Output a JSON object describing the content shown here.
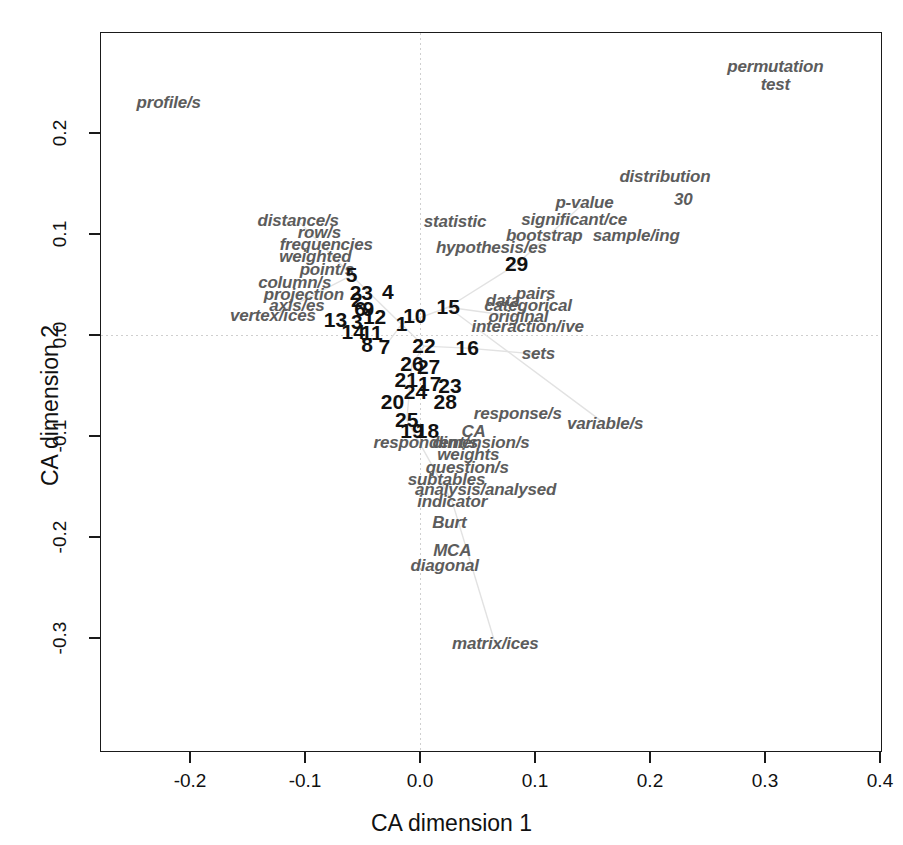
{
  "chart_data": {
    "type": "scatter",
    "title": "",
    "xlabel": "CA dimension 1",
    "ylabel": "CA dimension 2",
    "xlim": [
      -0.28,
      0.4175
    ],
    "ylim": [
      -0.315,
      0.285
    ],
    "xticks": [
      "-0.2",
      "-0.1",
      "0.0",
      "0.1",
      "0.2",
      "0.3",
      "0.4"
    ],
    "xtickvals": [
      -0.2,
      -0.1,
      0.0,
      0.1,
      0.2,
      0.3,
      0.4
    ],
    "yticks": [
      "0.2",
      "0.1",
      "0.0",
      "-0.1",
      "-0.2",
      "-0.3"
    ],
    "ytickvals": [
      0.2,
      0.1,
      0.0,
      -0.1,
      -0.2,
      -0.3
    ],
    "grid": false,
    "legend": "none",
    "zero_reference_lines": true,
    "colors": {
      "word_label": "#5c5c5c",
      "chapter_number": "#111111",
      "axis": "#1a1a1a",
      "edge": "#e2e2e2",
      "zero_line": "#cfcfcf"
    },
    "series": [
      {
        "name": "terms",
        "style": "italic-gray-text",
        "points": [
          {
            "label": "profile/s",
            "x": -0.2185,
            "y": 0.23
          },
          {
            "label": "permutation",
            "x": 0.309,
            "y": 0.265
          },
          {
            "label": "test",
            "x": 0.309,
            "y": 0.248
          },
          {
            "label": "distribution",
            "x": 0.213,
            "y": 0.156
          },
          {
            "label": "p-value",
            "x": 0.143,
            "y": 0.131
          },
          {
            "label": "30",
            "x": 0.229,
            "y": 0.134
          },
          {
            "label": "significant/ce",
            "x": 0.134,
            "y": 0.114
          },
          {
            "label": "distance/s",
            "x": -0.106,
            "y": 0.113
          },
          {
            "label": "statistic",
            "x": 0.0305,
            "y": 0.112
          },
          {
            "label": "bootstrap",
            "x": 0.108,
            "y": 0.098
          },
          {
            "label": "sample/ing",
            "x": 0.188,
            "y": 0.098
          },
          {
            "label": "row/s",
            "x": -0.0875,
            "y": 0.101
          },
          {
            "label": "frequencies",
            "x": -0.0815,
            "y": 0.089
          },
          {
            "label": "hypothesis/es",
            "x": 0.062,
            "y": 0.086
          },
          {
            "label": "weighted",
            "x": -0.091,
            "y": 0.077
          },
          {
            "label": "point/s",
            "x": -0.081,
            "y": 0.064
          },
          {
            "label": "column/s",
            "x": -0.109,
            "y": 0.051
          },
          {
            "label": "projection",
            "x": -0.101,
            "y": 0.04
          },
          {
            "label": "pairs",
            "x": 0.1005,
            "y": 0.041
          },
          {
            "label": "data",
            "x": 0.072,
            "y": 0.034
          },
          {
            "label": "categorical",
            "x": 0.094,
            "y": 0.029
          },
          {
            "label": "axis/es",
            "x": -0.107,
            "y": 0.029
          },
          {
            "label": "original",
            "x": 0.0855,
            "y": 0.018
          },
          {
            "label": "vertex/ices",
            "x": -0.128,
            "y": 0.019
          },
          {
            "label": "interaction/ive",
            "x": 0.0935,
            "y": 0.008
          },
          {
            "label": "sets",
            "x": 0.103,
            "y": -0.019
          },
          {
            "label": "response/s",
            "x": 0.085,
            "y": -0.078
          },
          {
            "label": "variable/s",
            "x": 0.161,
            "y": -0.088
          },
          {
            "label": "CA",
            "x": 0.0465,
            "y": -0.0965
          },
          {
            "label": "respondent/s",
            "x": 0.005,
            "y": -0.107
          },
          {
            "label": "dimension/s",
            "x": 0.053,
            "y": -0.107
          },
          {
            "label": "weights",
            "x": 0.042,
            "y": -0.1185
          },
          {
            "label": "question/s",
            "x": 0.041,
            "y": -0.132
          },
          {
            "label": "subtables",
            "x": 0.023,
            "y": -0.1435
          },
          {
            "label": "analysis/analysed",
            "x": 0.057,
            "y": -0.153
          },
          {
            "label": "indicator",
            "x": 0.028,
            "y": -0.165
          },
          {
            "label": "Burt",
            "x": 0.0255,
            "y": -0.186
          },
          {
            "label": "MCA",
            "x": 0.028,
            "y": -0.214
          },
          {
            "label": "diagonal",
            "x": 0.0215,
            "y": -0.229
          },
          {
            "label": "matrix/ices",
            "x": 0.0655,
            "y": -0.306
          }
        ]
      },
      {
        "name": "chapters",
        "style": "bold-black-number",
        "points": [
          {
            "label": "5",
            "x": -0.0595,
            "y": 0.059
          },
          {
            "label": "23",
            "x": -0.051,
            "y": 0.042
          },
          {
            "label": "2",
            "x": -0.055,
            "y": 0.035
          },
          {
            "label": "4",
            "x": -0.028,
            "y": 0.043
          },
          {
            "label": "6",
            "x": -0.052,
            "y": 0.0255
          },
          {
            "label": "9",
            "x": -0.045,
            "y": 0.0255
          },
          {
            "label": "13",
            "x": -0.0735,
            "y": 0.0145
          },
          {
            "label": "3",
            "x": -0.055,
            "y": 0.0125
          },
          {
            "label": "12",
            "x": -0.0395,
            "y": 0.018
          },
          {
            "label": "10",
            "x": -0.0045,
            "y": 0.0185
          },
          {
            "label": "15",
            "x": 0.0245,
            "y": 0.0275
          },
          {
            "label": "1",
            "x": -0.016,
            "y": 0.0105
          },
          {
            "label": "14",
            "x": -0.058,
            "y": 0.003
          },
          {
            "label": "11",
            "x": -0.042,
            "y": 0.002
          },
          {
            "label": "8",
            "x": -0.046,
            "y": -0.0095
          },
          {
            "label": "7",
            "x": -0.031,
            "y": -0.012
          },
          {
            "label": "22",
            "x": 0.0035,
            "y": -0.011
          },
          {
            "label": "16",
            "x": 0.041,
            "y": -0.013
          },
          {
            "label": "26",
            "x": -0.007,
            "y": -0.029
          },
          {
            "label": "27",
            "x": 0.0075,
            "y": -0.032
          },
          {
            "label": "21",
            "x": -0.012,
            "y": -0.045
          },
          {
            "label": "17",
            "x": 0.0085,
            "y": -0.049
          },
          {
            "label": "23b",
            "x": 0.026,
            "y": -0.05
          },
          {
            "label": "24",
            "x": -0.004,
            "y": -0.056
          },
          {
            "label": "20",
            "x": -0.024,
            "y": -0.0665
          },
          {
            "label": "28",
            "x": 0.022,
            "y": -0.066
          },
          {
            "label": "25",
            "x": -0.0115,
            "y": -0.084
          },
          {
            "label": "19",
            "x": -0.007,
            "y": -0.095
          },
          {
            "label": "18",
            "x": 0.0065,
            "y": -0.095
          },
          {
            "label": "29",
            "x": 0.084,
            "y": 0.07
          }
        ]
      }
    ],
    "edges": [
      {
        "x1": -0.016,
        "y1": 0.0105,
        "x2": 0.0245,
        "y2": 0.0275
      },
      {
        "x1": -0.016,
        "y1": 0.0105,
        "x2": 0.0035,
        "y2": -0.011
      },
      {
        "x1": 0.0035,
        "y1": -0.011,
        "x2": 0.041,
        "y2": -0.013
      },
      {
        "x1": 0.041,
        "y1": -0.013,
        "x2": 0.103,
        "y2": -0.019
      },
      {
        "x1": 0.0245,
        "y1": 0.0275,
        "x2": 0.0855,
        "y2": 0.018
      },
      {
        "x1": 0.0245,
        "y1": 0.0275,
        "x2": 0.084,
        "y2": 0.07
      },
      {
        "x1": 0.084,
        "y1": 0.07,
        "x2": 0.143,
        "y2": 0.131
      },
      {
        "x1": -0.016,
        "y1": 0.0105,
        "x2": -0.0595,
        "y2": 0.059
      },
      {
        "x1": -0.016,
        "y1": 0.0105,
        "x2": -0.031,
        "y2": -0.012
      },
      {
        "x1": 0.0035,
        "y1": -0.011,
        "x2": -0.007,
        "y2": -0.029
      },
      {
        "x1": -0.007,
        "y1": -0.029,
        "x2": -0.0115,
        "y2": -0.084
      },
      {
        "x1": -0.0115,
        "y1": -0.084,
        "x2": 0.028,
        "y2": -0.165
      },
      {
        "x1": 0.028,
        "y1": -0.165,
        "x2": 0.0655,
        "y2": -0.306
      },
      {
        "x1": -0.0595,
        "y1": 0.059,
        "x2": -0.106,
        "y2": 0.113
      },
      {
        "x1": -0.0595,
        "y1": 0.059,
        "x2": -0.128,
        "y2": 0.019
      },
      {
        "x1": 0.0245,
        "y1": 0.0275,
        "x2": 0.161,
        "y2": -0.088
      }
    ]
  },
  "axes": {
    "x_title": "CA dimension 1",
    "y_title": "CA dimension 2"
  }
}
